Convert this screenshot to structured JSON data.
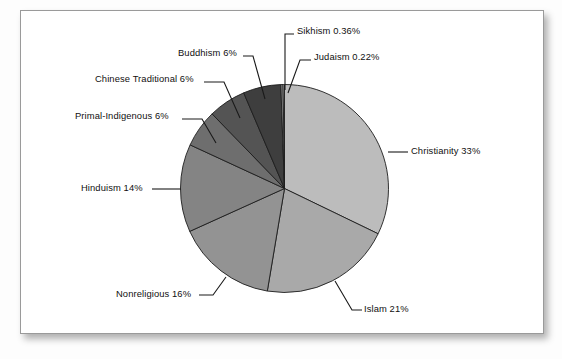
{
  "chart_data": {
    "type": "pie",
    "title": "",
    "subtitle": "",
    "xlabel": "",
    "ylabel": "",
    "legend_position": "none",
    "grid": false,
    "label_format": "{name} {value}%",
    "start_angle_deg": 0,
    "direction": "clockwise",
    "categories": [
      "Christianity",
      "Islam",
      "Nonreligious",
      "Hinduism",
      "Primal-Indigenous",
      "Chinese Traditional",
      "Buddhism",
      "Sikhism",
      "Judaism"
    ],
    "values": [
      33,
      21,
      16,
      14,
      6,
      6,
      6,
      0.36,
      0.22
    ],
    "slices": [
      {
        "name": "Christianity",
        "value": 33,
        "value_text": "33",
        "label": "Christianity 33%",
        "color": "#bcbcbc"
      },
      {
        "name": "Islam",
        "value": 21,
        "value_text": "21",
        "label": "Islam 21%",
        "color": "#a9a9a9"
      },
      {
        "name": "Nonreligious",
        "value": 16,
        "value_text": "16",
        "label": "Nonreligious 16%",
        "color": "#939393"
      },
      {
        "name": "Hinduism",
        "value": 14,
        "value_text": "14",
        "label": "Hinduism 14%",
        "color": "#848484"
      },
      {
        "name": "Primal-Indigenous",
        "value": 6,
        "value_text": "6",
        "label": "Primal-Indigenous 6%",
        "color": "#6e6e6e"
      },
      {
        "name": "Chinese Traditional",
        "value": 6,
        "value_text": "6",
        "label": "Chinese Traditional 6%",
        "color": "#545454"
      },
      {
        "name": "Buddhism",
        "value": 6,
        "value_text": "6",
        "label": "Buddhism 6%",
        "color": "#3e3e3e"
      },
      {
        "name": "Sikhism",
        "value": 0.36,
        "value_text": "0.36",
        "label": "Sikhism 0.36%",
        "color": "#8d8d8d"
      },
      {
        "name": "Judaism",
        "value": 0.22,
        "value_text": "0.22",
        "label": "Judaism 0.22%",
        "color": "#d6d6d6"
      }
    ]
  },
  "labels": {
    "christianity": "Christianity 33%",
    "islam": "Islam 21%",
    "nonreligious": "Nonreligious 16%",
    "hinduism": "Hinduism 14%",
    "primal_indigenous": "Primal-Indigenous 6%",
    "chinese_traditional": "Chinese Traditional 6%",
    "buddhism": "Buddhism 6%",
    "sikhism": "Sikhism 0.36%",
    "judaism": "Judaism 0.22%"
  },
  "colors": {
    "frame_border": "#9a9a9a",
    "panel_background": "#ffffff",
    "slice_outline": "#1d1d1d",
    "leader_line": "#1a1a1a",
    "label_text": "#101010"
  }
}
